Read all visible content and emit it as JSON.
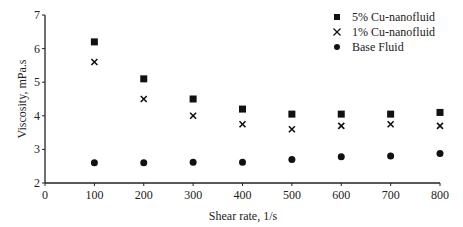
{
  "chart_data": {
    "type": "scatter",
    "title": "",
    "xlabel": "Shear rate, 1/s",
    "ylabel": "Viscosity, mPa.s",
    "xlim": [
      0,
      800
    ],
    "ylim": [
      2,
      7
    ],
    "x_ticks": [
      0,
      100,
      200,
      300,
      400,
      500,
      600,
      700,
      800
    ],
    "y_ticks": [
      2,
      3,
      4,
      5,
      6,
      7
    ],
    "grid": false,
    "legend_position": "top-right",
    "x": [
      100,
      200,
      300,
      400,
      500,
      600,
      700,
      800
    ],
    "series": [
      {
        "name": "5% Cu-nanofluid",
        "marker": "square",
        "values": [
          6.2,
          5.1,
          4.5,
          4.2,
          4.05,
          4.05,
          4.05,
          4.1
        ]
      },
      {
        "name": "1% Cu-nanofluid",
        "marker": "x",
        "values": [
          5.6,
          4.5,
          4.0,
          3.75,
          3.6,
          3.7,
          3.75,
          3.7
        ]
      },
      {
        "name": "Base Fluid",
        "marker": "circle",
        "values": [
          2.6,
          2.6,
          2.62,
          2.62,
          2.7,
          2.78,
          2.8,
          2.88
        ]
      }
    ]
  }
}
